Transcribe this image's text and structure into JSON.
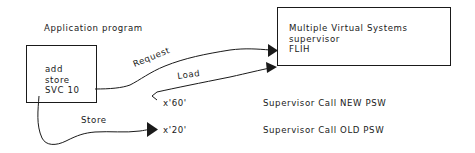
{
  "diagram": {
    "app_label": "Application program",
    "app_box": {
      "lines": [
        "add",
        "store",
        "SVC 10"
      ]
    },
    "supervisor_box": {
      "lines": [
        "Multiple Virtual Systems",
        "supervisor",
        "FLIH"
      ]
    },
    "arrows": {
      "request": "Request",
      "load": "Load",
      "store": "Store"
    },
    "addresses": {
      "new_psw_addr": "x'60'",
      "old_psw_addr": "x'20'"
    },
    "descriptions": {
      "new_psw": "Supervisor Call NEW PSW",
      "old_psw": "Supervisor Call OLD PSW"
    },
    "colors": {
      "line": "#1a1a1a",
      "background": "#ffffff"
    }
  }
}
